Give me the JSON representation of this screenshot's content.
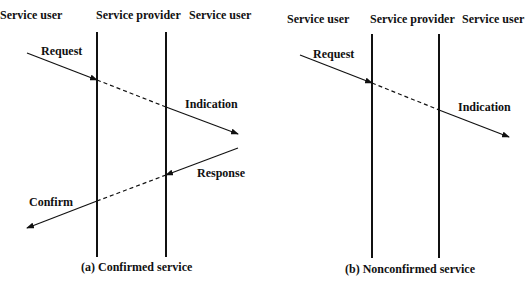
{
  "diagram_a": {
    "headers": [
      "Service user",
      "Service provider",
      "Service user"
    ],
    "messages": [
      "Request",
      "Indication",
      "Response",
      "Confirm"
    ],
    "caption": "(a) Confirmed service"
  },
  "diagram_b": {
    "headers": [
      "Service user",
      "Service provider",
      "Service user"
    ],
    "messages": [
      "Request",
      "Indication"
    ],
    "caption": "(b) Nonconfirmed service"
  },
  "colors": {
    "line": "#111111",
    "background": "#ffffff"
  }
}
